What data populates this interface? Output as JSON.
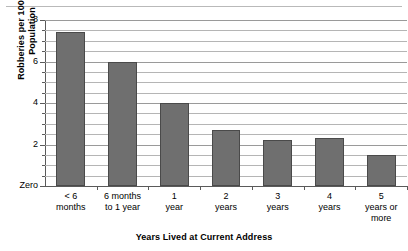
{
  "chart_data": {
    "type": "bar",
    "title": "",
    "subtitle": "",
    "xlabel": "Years Lived at Current Address",
    "ylabel": "Robberies per 100,000\nPopulation",
    "categories": [
      "< 6\nmonths",
      "6 months\nto 1 year",
      "1\nyear",
      "2\nyears",
      "3\nyears",
      "4\nyears",
      "5\nyears or\nmore"
    ],
    "values": [
      7.4,
      6.0,
      4.0,
      2.7,
      2.2,
      2.3,
      1.5
    ],
    "ylim": [
      0,
      8
    ],
    "y_major_ticks": [
      8,
      6,
      4,
      2,
      0
    ],
    "y_major_tick_labels": [
      "8",
      "6",
      "4",
      "2",
      "Zero"
    ],
    "y_minor_ticks": [
      7.5,
      7,
      6.5,
      5.5,
      5,
      4.5,
      3.5,
      3,
      2.5,
      1.5,
      1,
      0.5
    ],
    "gridlines": [
      8,
      7.5,
      7,
      6.5,
      6,
      5.5,
      5,
      4.5,
      4,
      3.5,
      3,
      2.5,
      2,
      1.5,
      1,
      0.5
    ],
    "grid": true,
    "legend": null,
    "legend_position": "none",
    "bar_color": "#6f6f6f",
    "bar_edge_color": "#4a4a4a",
    "grid_color": "#9a9a9a",
    "axis_color": "#5a5a5a"
  }
}
